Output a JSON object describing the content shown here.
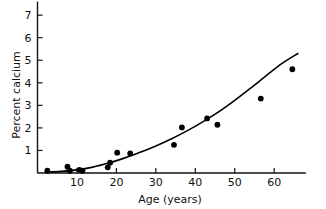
{
  "chart_data": {
    "type": "scatter",
    "title": "",
    "xlabel": "Age (years)",
    "ylabel": "Percent calcium",
    "xlim": [
      0,
      68
    ],
    "ylim": [
      0,
      7.6
    ],
    "grid": false,
    "legend": "none",
    "xticks": [
      10,
      20,
      30,
      40,
      50,
      60
    ],
    "yticks": [
      1,
      2,
      3,
      4,
      5,
      6,
      7
    ],
    "xtick_labels": [
      "10",
      "20",
      "30",
      "40",
      "50",
      "60"
    ],
    "ytick_labels": [
      "1",
      "2",
      "3",
      "4",
      "5",
      "6",
      "7"
    ],
    "series": [
      {
        "name": "observations",
        "marker": "filled-circle",
        "color": "#000000",
        "points": [
          {
            "x": 2.5,
            "y": 0.1
          },
          {
            "x": 7.6,
            "y": 0.28
          },
          {
            "x": 8.2,
            "y": 0.1
          },
          {
            "x": 10.6,
            "y": 0.14
          },
          {
            "x": 11.4,
            "y": 0.1
          },
          {
            "x": 17.8,
            "y": 0.25
          },
          {
            "x": 18.4,
            "y": 0.46
          },
          {
            "x": 20.2,
            "y": 0.9
          },
          {
            "x": 23.5,
            "y": 0.87
          },
          {
            "x": 34.6,
            "y": 1.25
          },
          {
            "x": 36.6,
            "y": 2.02
          },
          {
            "x": 43.0,
            "y": 2.42
          },
          {
            "x": 45.6,
            "y": 2.14
          },
          {
            "x": 56.6,
            "y": 3.3
          },
          {
            "x": 64.6,
            "y": 4.6
          }
        ]
      },
      {
        "name": "fitted-curve",
        "marker": "none",
        "color": "#000000",
        "points": [
          {
            "x": 2.0,
            "y": 0.04
          },
          {
            "x": 6.0,
            "y": 0.07
          },
          {
            "x": 10.0,
            "y": 0.14
          },
          {
            "x": 14.0,
            "y": 0.26
          },
          {
            "x": 18.0,
            "y": 0.44
          },
          {
            "x": 22.0,
            "y": 0.66
          },
          {
            "x": 26.0,
            "y": 0.92
          },
          {
            "x": 30.0,
            "y": 1.2
          },
          {
            "x": 34.0,
            "y": 1.52
          },
          {
            "x": 38.0,
            "y": 1.88
          },
          {
            "x": 42.0,
            "y": 2.28
          },
          {
            "x": 46.0,
            "y": 2.72
          },
          {
            "x": 50.0,
            "y": 3.22
          },
          {
            "x": 54.0,
            "y": 3.76
          },
          {
            "x": 58.0,
            "y": 4.32
          },
          {
            "x": 62.0,
            "y": 4.86
          },
          {
            "x": 66.0,
            "y": 5.3
          }
        ]
      }
    ]
  }
}
